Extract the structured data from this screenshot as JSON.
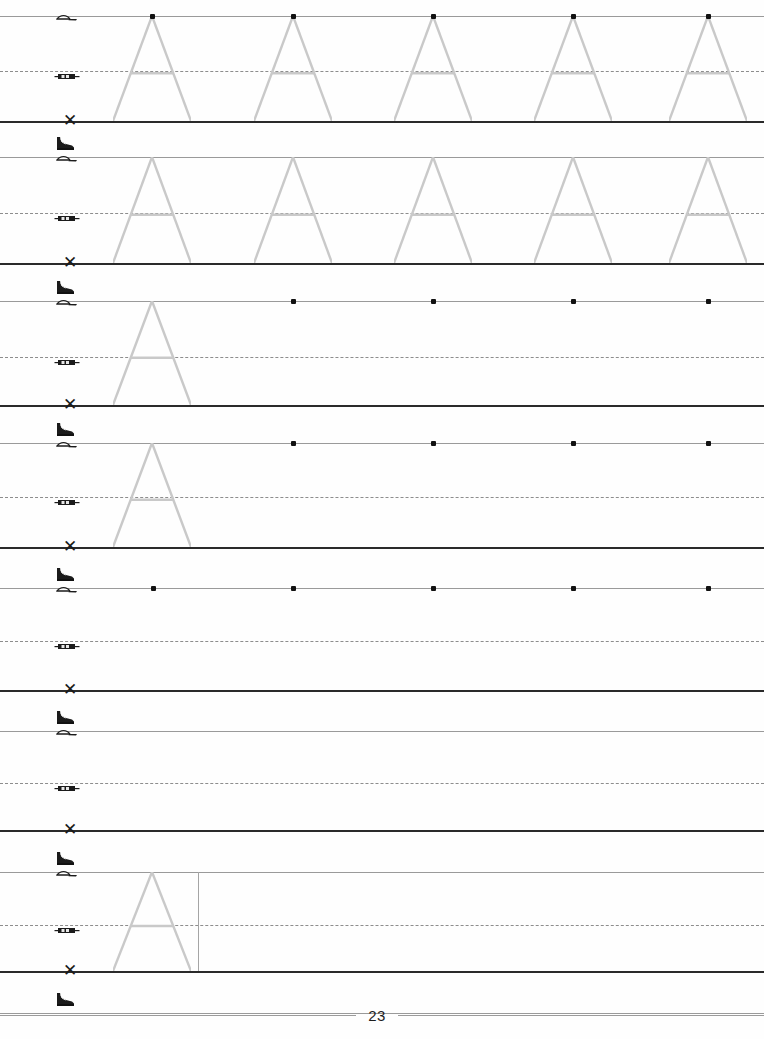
{
  "document": {
    "type": "handwriting-practice-worksheet",
    "letter": "A",
    "page_number": "23",
    "title": "Letter A tracing practice"
  },
  "icons": {
    "top_line_upper": "boot-icon",
    "top_line_lower": "cap-icon",
    "mid_line": "car-icon",
    "base_line": "x-mark-icon"
  },
  "geometry": {
    "page_width": 764,
    "page_height": 1039,
    "left_margin": 48,
    "letter_left": 113,
    "letter_width": 78,
    "letter_apex_offset": 39
  },
  "rows": [
    {
      "id": "row-1",
      "top": 16,
      "mid": 71,
      "base": 121,
      "icons": {
        "boot": false,
        "cap": true,
        "car": true,
        "x": true
      },
      "letters": [
        113,
        254,
        394,
        534,
        669
      ],
      "start_dots": [
        152,
        293,
        433,
        573,
        708
      ],
      "divider": null
    },
    {
      "id": "row-2",
      "top": 157,
      "mid": 213,
      "base": 263,
      "icons": {
        "boot": true,
        "cap": true,
        "car": true,
        "x": true
      },
      "letters": [
        113,
        254,
        394,
        534,
        669
      ],
      "start_dots": [],
      "divider": null
    },
    {
      "id": "row-3",
      "top": 301,
      "mid": 357,
      "base": 405,
      "icons": {
        "boot": true,
        "cap": true,
        "car": true,
        "x": true
      },
      "letters": [
        113
      ],
      "start_dots": [
        293,
        433,
        573,
        708
      ],
      "divider": null
    },
    {
      "id": "row-4",
      "top": 443,
      "mid": 497,
      "base": 547,
      "icons": {
        "boot": true,
        "cap": true,
        "car": true,
        "x": true
      },
      "letters": [
        113
      ],
      "start_dots": [
        293,
        433,
        573,
        708
      ],
      "divider": null
    },
    {
      "id": "row-5",
      "top": 588,
      "mid": 641,
      "base": 690,
      "icons": {
        "boot": true,
        "cap": true,
        "car": true,
        "x": true
      },
      "letters": [],
      "start_dots": [
        153,
        293,
        433,
        573,
        708
      ],
      "divider": null
    },
    {
      "id": "row-6",
      "top": 731,
      "mid": 783,
      "base": 830,
      "icons": {
        "boot": true,
        "cap": true,
        "car": true,
        "x": true
      },
      "letters": [],
      "start_dots": [],
      "divider": null
    },
    {
      "id": "row-7",
      "top": 872,
      "mid": 925,
      "base": 971,
      "icons": {
        "boot": true,
        "cap": true,
        "car": true,
        "x": true
      },
      "letters": [
        113
      ],
      "start_dots": [],
      "divider": 198
    },
    {
      "id": "row-8",
      "top": 1013,
      "mid": null,
      "base": null,
      "icons": {
        "boot": true,
        "cap": false,
        "car": false,
        "x": false
      },
      "letters": [],
      "start_dots": [],
      "divider": null
    }
  ],
  "colors": {
    "stroke_letter": "#c9c9c9",
    "baseline": "#2a2a2a",
    "topline": "#9a9a9a",
    "midline": "#8d8d8d",
    "dot": "#111111",
    "paper": "#fefefe"
  }
}
